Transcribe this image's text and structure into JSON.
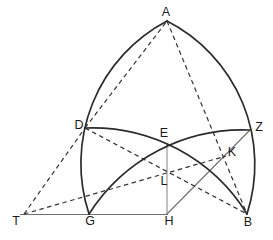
{
  "labels": {
    "A": "A",
    "D": "D",
    "E": "E",
    "Z": "Z",
    "K": "K",
    "L": "L",
    "T": "T",
    "G": "G",
    "H": "H",
    "B": "B"
  },
  "colors": {
    "background": "#ffffff",
    "arc": "#2b2b2b",
    "thin": "#6e6e6e",
    "vertical": "#8d8d8d",
    "dashed": "#333333",
    "label": "#1a1a1a"
  }
}
